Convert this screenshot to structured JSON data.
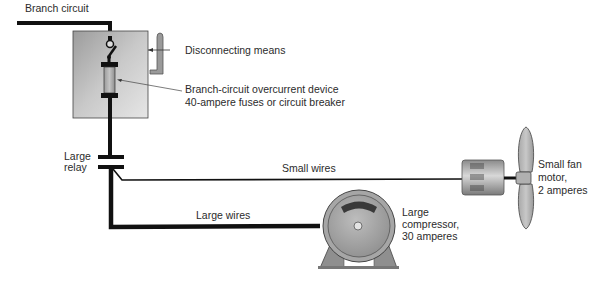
{
  "diagram": {
    "type": "electrical-wiring",
    "labels": {
      "branch_circuit": "Branch circuit",
      "disconnecting_means": "Disconnecting means",
      "overcurrent_line1": "Branch-circuit overcurrent device",
      "overcurrent_line2": "40-ampere fuses or circuit breaker",
      "relay_line1": "Large",
      "relay_line2": "relay",
      "small_wires": "Small wires",
      "large_wires": "Large wires",
      "compressor_line1": "Large",
      "compressor_line2": "compressor,",
      "compressor_line3": "30 amperes",
      "fan_line1": "Small fan",
      "fan_line2": "motor,",
      "fan_line3": "2 amperes"
    },
    "components": [
      {
        "name": "branch-circuit",
        "kind": "wire"
      },
      {
        "name": "disconnect-box",
        "kind": "enclosure",
        "contains": [
          "switch",
          "fuse"
        ]
      },
      {
        "name": "disconnect-handle",
        "kind": "handle"
      },
      {
        "name": "large-relay",
        "kind": "relay-contacts"
      },
      {
        "name": "small-wires",
        "kind": "wire",
        "connects": [
          "large-relay",
          "small-fan-motor"
        ]
      },
      {
        "name": "large-wires",
        "kind": "wire",
        "connects": [
          "large-relay",
          "large-compressor"
        ]
      },
      {
        "name": "large-compressor",
        "kind": "motor",
        "current": "30 amperes"
      },
      {
        "name": "small-fan-motor",
        "kind": "motor",
        "current": "2 amperes"
      }
    ],
    "colors": {
      "wire": "#111111",
      "box_fill": "#c8c8c8",
      "motor_fill": "#a8a8a8",
      "text": "#2b2b2b"
    }
  }
}
